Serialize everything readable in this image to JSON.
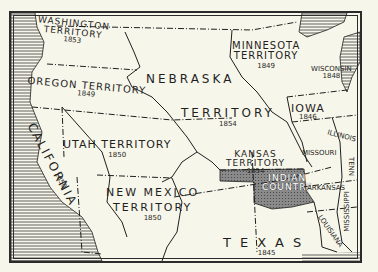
{
  "map": {
    "title": "US Territories, mid-1800s",
    "colors": {
      "paper": "#f7f6ea",
      "ink": "#1f1f1f",
      "water_hatch": "#3a3a3a",
      "indian_country": "#7a7a7a"
    },
    "regions": [
      {
        "id": "washington",
        "name_line1": "WASHINGTON",
        "name_line2": "TERRITORY",
        "year": "1853"
      },
      {
        "id": "oregon",
        "name_line1": "OREGON TERRITORY",
        "year": "1849"
      },
      {
        "id": "california",
        "name_line1": "CALIFORNIA",
        "year": "1850"
      },
      {
        "id": "utah",
        "name_line1": "UTAH TERRITORY",
        "year": "1850"
      },
      {
        "id": "nebraska",
        "name_line1": "NEBRASKA",
        "name_line2": "TERRITORY",
        "year": "1854"
      },
      {
        "id": "minnesota",
        "name_line1": "MINNESOTA",
        "name_line2": "TERRITORY",
        "year": "1849"
      },
      {
        "id": "wisconsin",
        "name_line1": "WISCONSIN",
        "year": "1848"
      },
      {
        "id": "iowa",
        "name_line1": "IOWA",
        "year": "1846"
      },
      {
        "id": "illinois",
        "name_line1": "ILLINOIS"
      },
      {
        "id": "missouri",
        "name_line1": "MISSOURI"
      },
      {
        "id": "kansas",
        "name_line1": "KANSAS",
        "name_line2": "TERRITORY",
        "year": "1854"
      },
      {
        "id": "indian_country",
        "name_line1": "INDIAN",
        "name_line2": "COUNTRY"
      },
      {
        "id": "arkansas",
        "name_line1": "ARKANSAS"
      },
      {
        "id": "tennessee",
        "name_line1": "TENN"
      },
      {
        "id": "mississippi",
        "name_line1": "MISSISSIPPI"
      },
      {
        "id": "louisiana",
        "name_line1": "LOUISIANA"
      },
      {
        "id": "new_mexico",
        "name_line1": "NEW MEXICO",
        "name_line2": "TERRITORY",
        "year": "1850"
      },
      {
        "id": "texas",
        "name_line1": "TEXAS",
        "year": "1845"
      }
    ]
  }
}
